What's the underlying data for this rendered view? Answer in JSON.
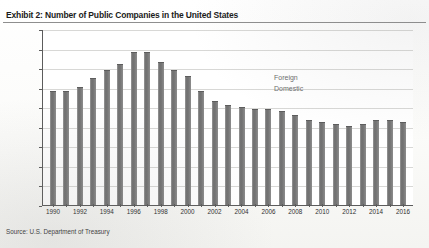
{
  "exhibit": {
    "title": "Exhibit 2: Number of Public Companies in the United States",
    "source": "Source: U.S. Department of Treasury"
  },
  "legend": {
    "foreign_label": "Foreign",
    "domestic_label": "Domestic"
  },
  "colors": {
    "bar_fill": "#777777",
    "bar_edge": "#5d5d5d",
    "gridline": "#d8d8d6",
    "axis": "#5c5c5c",
    "title_text": "#1b1b1b",
    "legend_text": "#6d6d6d",
    "background": "#ffffff"
  },
  "chart_data": {
    "type": "bar",
    "title": "Exhibit 2: Number of Public Companies in the United States",
    "subtitle": "",
    "xlabel": "",
    "ylabel": "",
    "ylim": [
      0,
      9000
    ],
    "ytick_values": [
      0,
      1000,
      2000,
      3000,
      4000,
      5000,
      6000,
      7000,
      8000,
      9000
    ],
    "ytick_labels": [
      "0",
      "1,000",
      "2,000",
      "3,000",
      "4,000",
      "5,000",
      "6,000",
      "7,000",
      "8,000",
      "9,000"
    ],
    "grid": true,
    "legend_position": "inside-top-center",
    "legend_entries": [
      "Foreign",
      "Domestic"
    ],
    "categories": [
      1990,
      1991,
      1992,
      1993,
      1994,
      1995,
      1996,
      1997,
      1998,
      1999,
      2000,
      2001,
      2002,
      2003,
      2004,
      2005,
      2006,
      2007,
      2008,
      2009,
      2010,
      2011,
      2012,
      2013,
      2014,
      2015,
      2016
    ],
    "xtick_labels": [
      "1990",
      "1991",
      "1992",
      "1993",
      "1994",
      "1995",
      "1996",
      "1997",
      "1998",
      "1999",
      "2000",
      "2001",
      "2002",
      "2003",
      "2004",
      "2005",
      "2006",
      "2007",
      "2008",
      "2009",
      "2010",
      "2011",
      "2012",
      "2013",
      "2014",
      "2015",
      "2016"
    ],
    "xtick_labels_shown": [
      "1990",
      "1992",
      "1994",
      "1996",
      "1998",
      "2000",
      "2002",
      "2004",
      "2006",
      "2008",
      "2010",
      "2012",
      "2014",
      "2016"
    ],
    "values": [
      5900,
      5900,
      6100,
      6600,
      7000,
      7300,
      7900,
      7900,
      7400,
      7000,
      6700,
      5900,
      5400,
      5200,
      5100,
      5000,
      5000,
      4900,
      4700,
      4400,
      4300,
      4200,
      4100,
      4200,
      4400,
      4400,
      4300
    ],
    "series": [
      {
        "name": "Domestic",
        "values": [
          5900,
          5900,
          6100,
          6600,
          7000,
          7300,
          7900,
          7900,
          7400,
          7000,
          6700,
          5900,
          5400,
          5200,
          5100,
          5000,
          5000,
          4900,
          4700,
          4400,
          4300,
          4200,
          4100,
          4200,
          4400,
          4400,
          4300
        ]
      }
    ],
    "annotations": [
      "Foreign",
      "Domestic"
    ]
  }
}
